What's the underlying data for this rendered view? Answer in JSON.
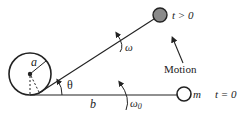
{
  "diagram": {
    "type": "physics-rotation-tether",
    "labels": {
      "radius": "a",
      "angle": "θ",
      "length": "b",
      "omega": "ω",
      "omega0_base": "ω",
      "omega0_sub": "0",
      "motion": "Motion",
      "mass": "m",
      "t_initial": "t = 0",
      "t_later": "t > 0"
    },
    "colors": {
      "stroke": "#222222",
      "mass_later_fill": "#8a8a8a",
      "mass_initial_fill": "#ffffff",
      "background": "#ffffff"
    }
  }
}
